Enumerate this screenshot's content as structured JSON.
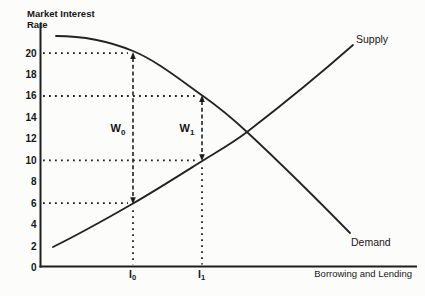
{
  "figure": {
    "y_axis_title_line1": "Market Interest",
    "y_axis_title_line2": "Rate",
    "x_axis_label": "Borrowing and Lending",
    "supply_label": "Supply",
    "demand_label": "Demand",
    "ink_color": "#1e1e1e",
    "paper_color": "#fcfcfa"
  },
  "chart_data": {
    "type": "line",
    "xlabel": "Borrowing and Lending",
    "ylabel": "Market Interest Rate",
    "ylim": [
      0,
      22
    ],
    "grid": false,
    "legend_position": "labels-on-curves",
    "y_ticks": [
      20,
      18,
      16,
      14,
      12,
      10,
      8,
      6,
      4,
      2,
      0
    ],
    "x_marks": [
      {
        "name": "I0",
        "label": "I",
        "sub": "0"
      },
      {
        "name": "I1",
        "label": "I",
        "sub": "1"
      }
    ],
    "series": [
      {
        "name": "Demand",
        "x_rel": [
          0.0,
          0.26,
          0.5,
          0.65,
          1.0
        ],
        "rates": [
          21.6,
          20,
          16,
          12.6,
          3.2
        ]
      },
      {
        "name": "Supply",
        "x_rel": [
          0.0,
          0.26,
          0.5,
          0.65,
          1.0
        ],
        "rates": [
          2,
          6,
          10,
          12.6,
          20.7
        ]
      }
    ],
    "guides": [
      {
        "rate": 20,
        "to_x": "I0"
      },
      {
        "rate": 16,
        "to_x": "I1"
      },
      {
        "rate": 10,
        "to_x": "I1"
      },
      {
        "rate": 6,
        "to_x": "I0"
      }
    ],
    "wedges": [
      {
        "x": "I0",
        "top_rate": 20,
        "bottom_rate": 6,
        "label": "W",
        "sub": "0"
      },
      {
        "x": "I1",
        "top_rate": 16,
        "bottom_rate": 10,
        "label": "W",
        "sub": "1"
      }
    ],
    "key_points": {
      "at_I0": {
        "demand_rate": 20,
        "supply_rate": 6
      },
      "at_I1": {
        "demand_rate": 16,
        "supply_rate": 10
      },
      "equilibrium_rate_approx": 12.6
    }
  }
}
